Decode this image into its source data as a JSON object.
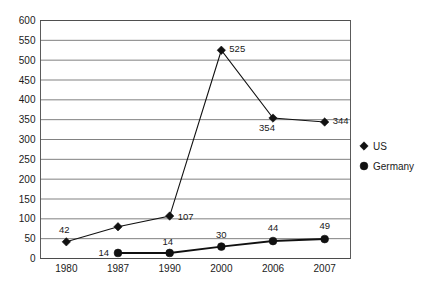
{
  "chart_data": {
    "type": "line",
    "title": "",
    "xlabel": "",
    "ylabel": "",
    "categories": [
      "1980",
      "1987",
      "1990",
      "2000",
      "2006",
      "2007"
    ],
    "ylim": [
      0,
      600
    ],
    "ytick_step": 50,
    "yticks": [
      "0",
      "50",
      "100",
      "150",
      "200",
      "250",
      "300",
      "350",
      "400",
      "450",
      "500",
      "550",
      "600"
    ],
    "grid": "horizontal",
    "legend_position": "right",
    "series": [
      {
        "name": "US",
        "marker": "diamond",
        "values": [
          42,
          80,
          107,
          525,
          354,
          344
        ],
        "labels": [
          "42",
          "",
          "107",
          "525",
          "354",
          "344"
        ]
      },
      {
        "name": "Germany",
        "marker": "circle",
        "values": [
          null,
          14,
          14,
          30,
          44,
          49
        ],
        "labels": [
          "",
          "14",
          "14",
          "30",
          "44",
          "49"
        ]
      }
    ]
  },
  "legend": {
    "items": [
      {
        "label": "US",
        "marker": "diamond"
      },
      {
        "label": "Germany",
        "marker": "circle"
      }
    ]
  },
  "colors": {
    "series": "#111111",
    "grid": "#4a4a4a",
    "background": "#ffffff"
  }
}
